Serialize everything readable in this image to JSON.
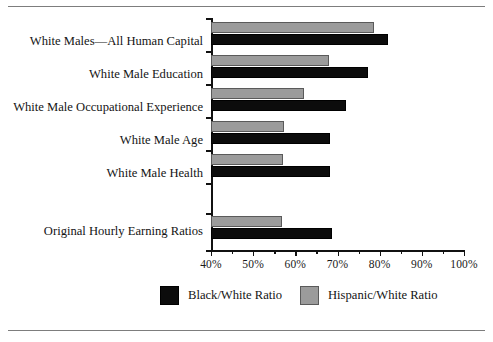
{
  "chart_data": {
    "type": "bar",
    "orientation": "horizontal",
    "title": "",
    "subtitle": "",
    "xlabel": "",
    "ylabel": "",
    "xlim": [
      40,
      100
    ],
    "xtick_labels": [
      "40%",
      "50%",
      "60%",
      "70%",
      "80%",
      "90%",
      "100%"
    ],
    "xtick_values": [
      40,
      50,
      60,
      70,
      80,
      90,
      100
    ],
    "xtick_minor_values": [
      45,
      55,
      65,
      75,
      85,
      95
    ],
    "grid": false,
    "legend_position": "bottom",
    "categories": [
      "White Males—All Human Capital",
      "White Male Education",
      "White Male Occupational Experience",
      "White Male Age",
      "White Male Health",
      "",
      "Original Hourly Earning Ratios"
    ],
    "series": [
      {
        "name": "Hispanic/White Ratio",
        "color": "#9b9b9b",
        "values": [
          78.7,
          68.0,
          62.0,
          57.3,
          57.0,
          null,
          56.8
        ]
      },
      {
        "name": "Black/White Ratio",
        "color": "#0c0c0c",
        "values": [
          82.0,
          77.2,
          72.0,
          68.2,
          68.2,
          null,
          68.7
        ]
      }
    ]
  },
  "axis": {
    "ticks": [
      {
        "label": "40%",
        "value": 40
      },
      {
        "label": "50%",
        "value": 50
      },
      {
        "label": "60%",
        "value": 60
      },
      {
        "label": "70%",
        "value": 70
      },
      {
        "label": "80%",
        "value": 80
      },
      {
        "label": "90%",
        "value": 90
      },
      {
        "label": "100%",
        "value": 100
      }
    ]
  },
  "categories": [
    {
      "label": "White Males—All Human Capital"
    },
    {
      "label": "White Male Education"
    },
    {
      "label": "White Male Occupational Experience"
    },
    {
      "label": "White Male Age"
    },
    {
      "label": "White Male Health"
    },
    {
      "label": ""
    },
    {
      "label": "Original Hourly Earning Ratios"
    }
  ],
  "legend": {
    "items": [
      {
        "label": "Black/White Ratio",
        "color": "#0c0c0c"
      },
      {
        "label": "Hispanic/White Ratio",
        "color": "#9b9b9b"
      }
    ]
  }
}
